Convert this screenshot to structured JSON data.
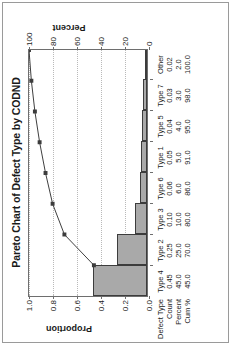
{
  "chart_data": {
    "type": "bar",
    "title": "Pareto Chart of Defect Type by CODND",
    "categories": [
      "Type 4",
      "Type 2",
      "Type 3",
      "Type 6",
      "Type 1",
      "Type 5",
      "Type 7",
      "Other"
    ],
    "values": [
      0.45,
      0.25,
      0.1,
      0.06,
      0.05,
      0.04,
      0.03,
      0.02
    ],
    "series": [
      {
        "name": "Count",
        "values": [
          0.45,
          0.25,
          0.1,
          0.06,
          0.05,
          0.04,
          0.03,
          0.02
        ]
      },
      {
        "name": "Percent",
        "values": [
          45.0,
          25.0,
          10.0,
          6.0,
          5.0,
          4.0,
          3.0,
          2.0
        ]
      },
      {
        "name": "Cum %",
        "values": [
          45.0,
          70.0,
          80.0,
          86.0,
          91.0,
          95.0,
          98.0,
          100.0
        ]
      }
    ],
    "xlabel": "",
    "ylabel": "Proportion",
    "y2label": "Percent",
    "ylim": [
      0,
      1.0
    ],
    "y2lim": [
      0,
      100
    ],
    "yticks": [
      "0.0",
      "0.2",
      "0.4",
      "0.6",
      "0.8",
      "1.0"
    ],
    "ytick_values": [
      0.0,
      0.2,
      0.4,
      0.6,
      0.8,
      1.0
    ],
    "y2ticks": [
      "0",
      "20",
      "40",
      "60",
      "80",
      "100"
    ],
    "y2tick_values": [
      0,
      20,
      40,
      60,
      80,
      100
    ],
    "grid": true,
    "legend": "none",
    "bar_color": "#a9a9a9",
    "bar_edge_color": "#3c3c3c",
    "line_color": "#3c3c3c",
    "marker": "square",
    "orientation": "rotated-90"
  },
  "table": {
    "row_labels": [
      "Defect Type",
      "Count",
      "Percent",
      "Cum %"
    ],
    "rows": [
      [
        "Type 4",
        "Type 2",
        "Type 3",
        "Type 6",
        "Type 1",
        "Type 5",
        "Type 7",
        "Other"
      ],
      [
        "0.45",
        "0.25",
        "0.10",
        "0.06",
        "0.05",
        "0.04",
        "0.03",
        "0.02"
      ],
      [
        "45.0",
        "25.0",
        "10.0",
        "6.0",
        "5.0",
        "4.0",
        "3.0",
        "2.0"
      ],
      [
        "45.0",
        "70.0",
        "80.0",
        "86.0",
        "91.0",
        "95.0",
        "98.0",
        "100.0"
      ]
    ]
  }
}
